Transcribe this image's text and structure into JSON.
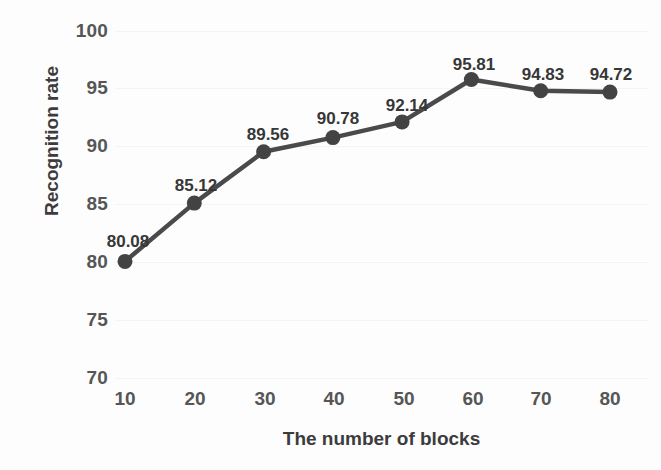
{
  "chart_data": {
    "type": "line",
    "title": "",
    "xlabel": "The number of blocks",
    "ylabel": "Recognition rate",
    "x": [
      10,
      20,
      30,
      40,
      50,
      60,
      70,
      80
    ],
    "values": [
      80.08,
      85.12,
      89.56,
      90.78,
      92.14,
      95.81,
      94.83,
      94.72
    ],
    "point_labels": [
      "80.08",
      "85.12",
      "89.56",
      "90.78",
      "92.14",
      "95.81",
      "94.83",
      "94.72"
    ],
    "xtick_labels": [
      "10",
      "20",
      "30",
      "40",
      "50",
      "60",
      "70",
      "80"
    ],
    "ytick_labels": [
      "100",
      "95",
      "90",
      "85",
      "80",
      "75",
      "70"
    ],
    "yticks": [
      100,
      95,
      90,
      85,
      80,
      75,
      70
    ],
    "xlim": [
      5,
      85
    ],
    "ylim": [
      70,
      100
    ],
    "grid": true,
    "legend": null,
    "series_color": "#4a4a4a",
    "marker": "circle",
    "marker_color": "#434343"
  }
}
